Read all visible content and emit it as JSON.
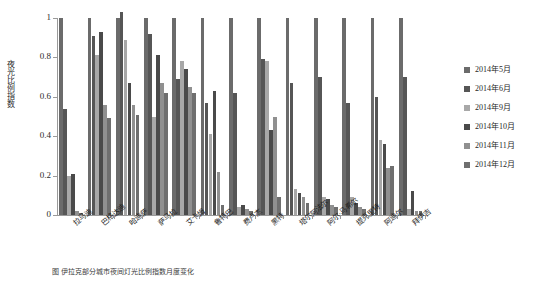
{
  "chart_data": {
    "type": "bar",
    "title": "",
    "xlabel": "",
    "ylabel": "夜光比例指数",
    "ylim": [
      0,
      1
    ],
    "yticks": [
      "0",
      "0.2",
      "0.4",
      "0.6",
      "0.8",
      "1"
    ],
    "grid": false,
    "legend_position": "right",
    "categories": [
      "拉马迪",
      "巴格达迪",
      "哈迪萨",
      "萨马拉",
      "艾卡姆",
      "鲁特巴",
      "费卢杰",
      "黑特",
      "塔尔阿法尔",
      "阿尔·马希尔",
      "提克里特",
      "阿迪尔",
      "拜伊吉"
    ],
    "series": [
      {
        "name": "2014年5月",
        "color": "#6b6b6b",
        "values": [
          1.0,
          1.0,
          1.0,
          1.0,
          1.0,
          1.0,
          1.0,
          1.0,
          1.0,
          1.0,
          1.0,
          1.0,
          1.0
        ]
      },
      {
        "name": "2014年6月",
        "color": "#565656",
        "values": [
          0.54,
          0.91,
          1.03,
          0.92,
          0.69,
          0.57,
          0.62,
          0.79,
          0.67,
          0.7,
          0.57,
          0.6,
          0.7
        ]
      },
      {
        "name": "2014年9月",
        "color": "#a8a8a8",
        "values": [
          0.2,
          0.81,
          0.89,
          0.5,
          0.78,
          0.41,
          0.04,
          0.78,
          0.13,
          0.09,
          0.09,
          0.38,
          0.03
        ]
      },
      {
        "name": "2014年10月",
        "color": "#4a4a4a",
        "values": [
          0.21,
          0.93,
          0.67,
          0.81,
          0.74,
          0.63,
          0.05,
          0.43,
          0.11,
          0.08,
          0.06,
          0.36,
          0.12
        ]
      },
      {
        "name": "2014年11月",
        "color": "#909090",
        "values": [
          0.02,
          0.56,
          0.56,
          0.67,
          0.65,
          0.22,
          0.03,
          0.5,
          0.09,
          0.05,
          0.04,
          0.24,
          0.02
        ]
      },
      {
        "name": "2014年12月",
        "color": "#6f6f6f",
        "values": [
          0.01,
          0.49,
          0.51,
          0.62,
          0.62,
          0.05,
          0.02,
          0.09,
          0.06,
          0.04,
          0.03,
          0.25,
          0.02
        ]
      }
    ]
  },
  "legend": {
    "items": [
      {
        "label": "2014年5月"
      },
      {
        "label": "2014年6月"
      },
      {
        "label": "2014年9月"
      },
      {
        "label": "2014年10月"
      },
      {
        "label": "2014年11月"
      },
      {
        "label": "2014年12月"
      }
    ]
  },
  "caption": {
    "text": "图    伊拉克部分城市夜间灯光比例指数月度变化"
  }
}
